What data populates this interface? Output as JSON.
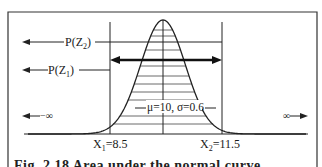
{
  "diagram": {
    "type": "normal-distribution-area",
    "labels": {
      "p_z2": "P(Z",
      "p_z2_sub": "2",
      "p_z1": "P(Z",
      "p_z1_sub": "1",
      "close_paren": ")",
      "neg_infinity": "−∞",
      "pos_infinity": "∞",
      "params": "μ=10, σ=0.6",
      "x1_prefix": "X",
      "x1_sub": "1",
      "x1_value": "=8.5",
      "x2_prefix": "X",
      "x2_sub": "2",
      "x2_value": "=11.5"
    },
    "distribution": {
      "mean": 10,
      "sigma": 0.6,
      "x1": 8.5,
      "x2": 11.5
    },
    "caption": "Fig. 2.18 Area under the normal curve"
  }
}
